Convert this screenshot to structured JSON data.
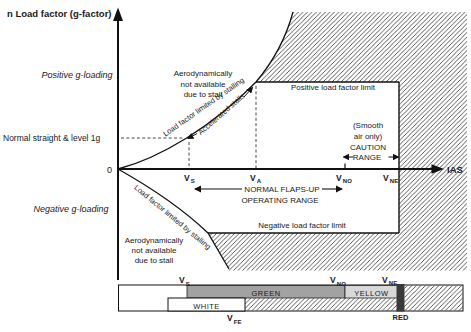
{
  "diagram": {
    "title": "n Load factor (g-factor)",
    "axis": {
      "ias": "IAS",
      "origin": "0"
    },
    "v_speeds": {
      "vs": {
        "v": "V",
        "sub": "S"
      },
      "va": {
        "v": "V",
        "sub": "A"
      },
      "vno": {
        "v": "V",
        "sub": "NO"
      },
      "vne": {
        "v": "V",
        "sub": "NE"
      },
      "vfe": {
        "v": "V",
        "sub": "FE"
      }
    },
    "labels": {
      "positive_g": "Positive g-loading",
      "negative_g": "Negative g-loading",
      "normal_level": "Normal straight & level 1g",
      "pos_limit": "Positive load factor limit",
      "neg_limit": "Negative load factor limit",
      "stall_curve_pos": "Load factor limited by stalling",
      "stall_curve_neg": "Load factor limited by stalling",
      "accelerated": "Accelerated stalls",
      "aero_na_top": [
        "Aerodynamically",
        "not available",
        "due to stall"
      ],
      "aero_na_bottom": [
        "Aerodynamically",
        "not available",
        "due to stall"
      ],
      "caution": [
        "(Smooth",
        "air only)",
        "CAUTION",
        "RANGE"
      ],
      "flaps_range": [
        "NORMAL FLAPS-UP",
        "OPERATING RANGE"
      ]
    }
  },
  "asi_bar": {
    "green_label": "GREEN",
    "yellow_label": "YELLOW",
    "white_label": "WHITE",
    "red_label": "RED",
    "colors": {
      "green": "#a2a2a2",
      "yellow": "#d8d8d8",
      "red": "#3a3a3a"
    }
  }
}
